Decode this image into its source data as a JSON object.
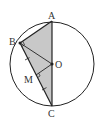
{
  "diagram": {
    "type": "geometry",
    "colors": {
      "stroke": "#222222",
      "fill": "#c8c8c8",
      "background": "#ffffff"
    },
    "circle": {
      "center": "O",
      "cx": 52,
      "cy": 64,
      "r": 42
    },
    "points": [
      {
        "id": "A",
        "label": "A",
        "x": 52,
        "y": 21,
        "label_x": 48,
        "label_y": 19
      },
      {
        "id": "B",
        "label": "B",
        "x": 20,
        "y": 43,
        "label_x": 9,
        "label_y": 45
      },
      {
        "id": "O",
        "label": "O",
        "x": 52,
        "y": 64,
        "label_x": 55,
        "label_y": 68
      },
      {
        "id": "M",
        "label": "M",
        "x": 36,
        "y": 75,
        "label_x": 24,
        "label_y": 83
      },
      {
        "id": "C",
        "label": "C",
        "x": 52,
        "y": 106,
        "label_x": 48,
        "label_y": 117
      }
    ],
    "segments": [
      [
        "A",
        "B"
      ],
      [
        "A",
        "C"
      ],
      [
        "B",
        "C"
      ],
      [
        "B",
        "O"
      ],
      [
        "O",
        "M"
      ]
    ],
    "shaded_polygon": [
      "A",
      "B",
      "C"
    ],
    "right_angles": [
      "B",
      "M"
    ],
    "tick_marks": {
      "segments": [
        "B-M",
        "M-C"
      ],
      "count": 1
    }
  }
}
